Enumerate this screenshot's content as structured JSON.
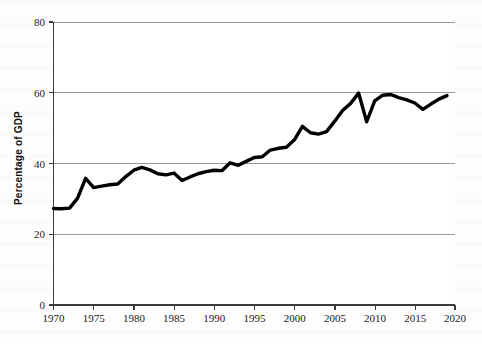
{
  "chart_data": {
    "type": "line",
    "title": "",
    "xlabel": "",
    "ylabel": "Percentage of GDP",
    "xlim": [
      1970,
      2020
    ],
    "ylim": [
      0,
      80
    ],
    "grid": true,
    "grid_axis": "y",
    "legend": "none",
    "line_color": "#000000",
    "x_ticks": [
      "1970",
      "1975",
      "1980",
      "1985",
      "1990",
      "1995",
      "2000",
      "2005",
      "2010",
      "2015",
      "2020"
    ],
    "y_ticks": [
      "0",
      "20",
      "40",
      "60",
      "80"
    ],
    "x": [
      1970,
      1971,
      1972,
      1973,
      1974,
      1975,
      1976,
      1977,
      1978,
      1979,
      1980,
      1981,
      1982,
      1983,
      1984,
      1985,
      1986,
      1987,
      1988,
      1989,
      1990,
      1991,
      1992,
      1993,
      1994,
      1995,
      1996,
      1997,
      1998,
      1999,
      2000,
      2001,
      2002,
      2003,
      2004,
      2005,
      2006,
      2007,
      2008,
      2009,
      2010,
      2011,
      2012,
      2013,
      2014,
      2015,
      2016,
      2017,
      2018,
      2019
    ],
    "values": [
      27.3,
      27.2,
      27.4,
      30.2,
      35.8,
      33.2,
      33.6,
      34.0,
      34.2,
      36.3,
      38.1,
      38.9,
      38.2,
      37.1,
      36.8,
      37.3,
      35.2,
      36.2,
      37.1,
      37.7,
      38.1,
      38.0,
      40.2,
      39.5,
      40.6,
      41.7,
      41.9,
      43.8,
      44.3,
      44.6,
      46.7,
      50.5,
      48.7,
      48.3,
      49.0,
      51.9,
      55.0,
      57.0,
      59.9,
      51.8,
      57.7,
      59.3,
      59.5,
      58.6,
      58.0,
      57.1,
      55.3,
      56.8,
      58.2,
      59.2
    ],
    "series_name": "Percentage of GDP"
  },
  "figure": {
    "y_axis_label": "Percentage of GDP"
  }
}
